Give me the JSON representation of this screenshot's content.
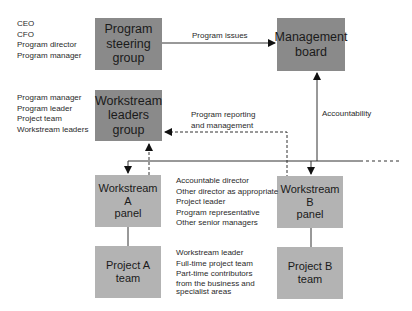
{
  "diagram": {
    "boxes": {
      "program_steering": "Program\nsteering\ngroup",
      "management_board": "Management\nboard",
      "workstream_leaders": "Workstream\nleaders\ngroup",
      "workstream_a": "Workstream A\npanel",
      "workstream_b": "Workstream B\npanel",
      "project_a": "Project A\nteam",
      "project_b": "Project B\nteam"
    },
    "member_lists": {
      "steering_members": [
        "CEO",
        "CFO",
        "Program director",
        "Program manager"
      ],
      "leaders_members": [
        "Program manager",
        "Program leader",
        "Project team",
        "Workstream leaders"
      ],
      "panel_members": [
        "Accountable director",
        "Other director as appropriate",
        "Project leader",
        "Program representative",
        "Other senior managers"
      ],
      "team_members": [
        "Workstream leader",
        "Full-time project team",
        "Part-time contributors",
        "from the business and",
        "specialist areas"
      ]
    },
    "edge_labels": {
      "program_issues": "Program issues",
      "program_reporting_1": "Program reporting",
      "program_reporting_2": "and management",
      "accountability": "Accountability"
    },
    "colors": {
      "dark_box": "#8a8a8a",
      "light_box": "#b3b3b3",
      "line": "#333333"
    }
  }
}
